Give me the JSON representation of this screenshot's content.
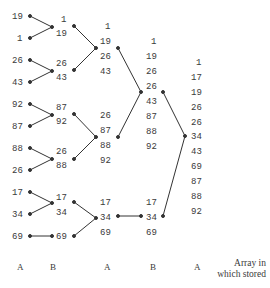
{
  "diagram": {
    "columns": [
      {
        "label": "A",
        "values": [
          "19",
          "1",
          "26",
          "43",
          "92",
          "87",
          "88",
          "26",
          "17",
          "34",
          "69"
        ]
      },
      {
        "label": "B",
        "values": [
          "1",
          "19",
          "26",
          "43",
          "87",
          "92",
          "26",
          "88",
          "17",
          "34",
          "69"
        ]
      },
      {
        "label": "A",
        "values": [
          "1",
          "19",
          "26",
          "43",
          "26",
          "87",
          "88",
          "92",
          "17",
          "34",
          "69"
        ]
      },
      {
        "label": "B",
        "values": [
          "1",
          "19",
          "26",
          "26",
          "43",
          "87",
          "88",
          "92",
          "17",
          "34",
          "69"
        ]
      },
      {
        "label": "A",
        "values": [
          "1",
          "17",
          "19",
          "26",
          "26",
          "34",
          "43",
          "69",
          "87",
          "88",
          "92"
        ]
      }
    ],
    "caption_line1": "Array in",
    "caption_line2": "which stored"
  }
}
